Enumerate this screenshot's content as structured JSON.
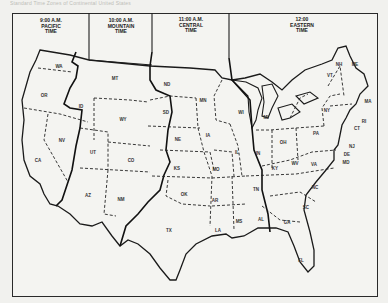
{
  "caption": "Standard Time Zones of Continental United States",
  "zones": [
    {
      "id": "pacific",
      "time": "9:00 A.M.",
      "name": "PACIFIC",
      "suffix": "TIME"
    },
    {
      "id": "mountain",
      "time": "10:00 A.M.",
      "name": "MOUNTAIN",
      "suffix": "TIME"
    },
    {
      "id": "central",
      "time": "11:00 A.M.",
      "name": "CENTRAL",
      "suffix": "TIME"
    },
    {
      "id": "eastern",
      "time": "12:00",
      "name": "EASTERN",
      "suffix": "TIME"
    }
  ],
  "states": {
    "WA": "WA",
    "OR": "OR",
    "CA": "CA",
    "NV": "NV",
    "ID": "ID",
    "MT": "MT",
    "WY": "WY",
    "UT": "UT",
    "CO": "CO",
    "AZ": "AZ",
    "NM": "NM",
    "ND": "ND",
    "SD": "SD",
    "NE": "NE",
    "KS": "KS",
    "OK": "OK",
    "TX": "TX",
    "MN": "MN",
    "IA": "IA",
    "MO": "MO",
    "AR": "AR",
    "LA": "LA",
    "WI": "WI",
    "IL": "IL",
    "MS": "MS",
    "AL": "AL",
    "TN": "TN",
    "MI": "MI",
    "IN": "IN",
    "OH": "OH",
    "KY": "KY",
    "WV": "WV",
    "VA": "VA",
    "NC": "NC",
    "SC": "SC",
    "GA": "GA",
    "FL": "FL",
    "PA": "PA",
    "NY": "NY",
    "NJ": "NJ",
    "DE": "DE",
    "MD": "MD",
    "CT": "CT",
    "RI": "RI",
    "MA": "MA",
    "VT": "VT",
    "NH": "NH",
    "ME": "ME"
  }
}
